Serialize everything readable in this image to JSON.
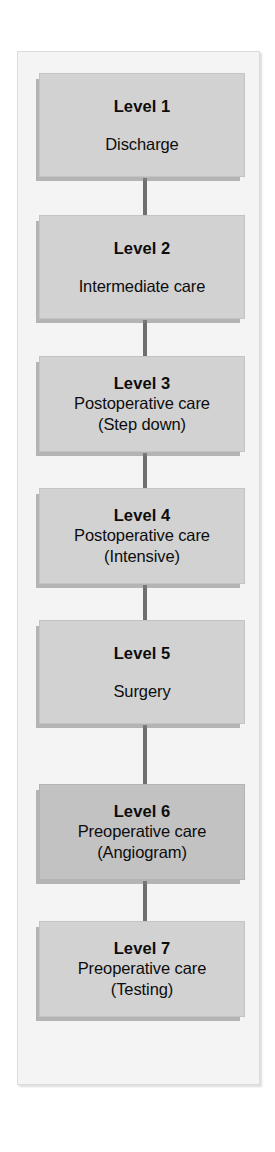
{
  "diagram": {
    "type": "vertical-flowchart",
    "title": "",
    "orientation": "top-to-bottom",
    "colors": {
      "page_background": "#ffffff",
      "frame_background": "#f4f4f4",
      "frame_border": "#dcdcdc",
      "node_fill": "#d2d2d2",
      "node_fill_highlight": "#c2c2c2",
      "node_shadow": "#808080",
      "connector": "#6f6f6f",
      "text": "#0d0d0d"
    },
    "nodes": [
      {
        "id": "level-1",
        "title": "Level 1",
        "lines": [
          "Discharge"
        ],
        "highlighted": false,
        "spaced": true
      },
      {
        "id": "level-2",
        "title": "Level 2",
        "lines": [
          "Intermediate care"
        ],
        "highlighted": false,
        "spaced": true
      },
      {
        "id": "level-3",
        "title": "Level 3",
        "lines": [
          "Postoperative care",
          "(Step down)"
        ],
        "highlighted": false,
        "spaced": false
      },
      {
        "id": "level-4",
        "title": "Level 4",
        "lines": [
          "Postoperative care",
          "(Intensive)"
        ],
        "highlighted": false,
        "spaced": false
      },
      {
        "id": "level-5",
        "title": "Level 5",
        "lines": [
          "Surgery"
        ],
        "highlighted": false,
        "spaced": true
      },
      {
        "id": "level-6",
        "title": "Level 6",
        "lines": [
          "Preoperative care",
          "(Angiogram)"
        ],
        "highlighted": true,
        "spaced": false
      },
      {
        "id": "level-7",
        "title": "Level 7",
        "lines": [
          "Preoperative care",
          "(Testing)"
        ],
        "highlighted": false,
        "spaced": false
      }
    ],
    "connectors": [
      {
        "from": "level-1",
        "to": "level-2"
      },
      {
        "from": "level-2",
        "to": "level-3"
      },
      {
        "from": "level-3",
        "to": "level-4"
      },
      {
        "from": "level-4",
        "to": "level-5"
      },
      {
        "from": "level-5",
        "to": "level-6"
      },
      {
        "from": "level-6",
        "to": "level-7"
      }
    ],
    "layout": {
      "node_left": 39,
      "node_width": 206,
      "connector_left": 143,
      "connector_width": 4,
      "nodes_geometry": [
        {
          "top": 73,
          "height": 104
        },
        {
          "top": 215,
          "height": 104
        },
        {
          "top": 356,
          "height": 96
        },
        {
          "top": 488,
          "height": 96
        },
        {
          "top": 620,
          "height": 104
        },
        {
          "top": 784,
          "height": 96
        },
        {
          "top": 921,
          "height": 96
        }
      ],
      "connectors_geometry": [
        {
          "top": 178,
          "height": 37
        },
        {
          "top": 320,
          "height": 36
        },
        {
          "top": 453,
          "height": 35
        },
        {
          "top": 585,
          "height": 35
        },
        {
          "top": 725,
          "height": 59
        },
        {
          "top": 881,
          "height": 40
        }
      ],
      "frame": {
        "left": 17,
        "top": 51,
        "width": 243,
        "height": 1034
      }
    }
  }
}
